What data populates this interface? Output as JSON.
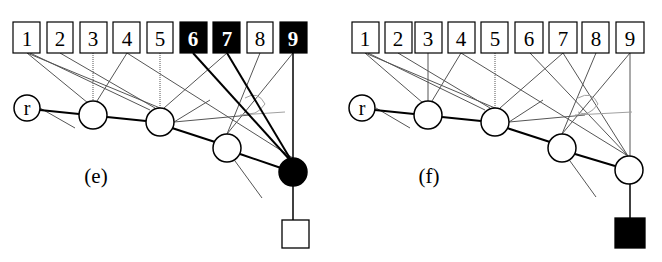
{
  "figure": {
    "panels": [
      {
        "id": "e",
        "caption": "(e)",
        "boxes": [
          {
            "label": "1",
            "filled": false
          },
          {
            "label": "2",
            "filled": false
          },
          {
            "label": "3",
            "filled": false
          },
          {
            "label": "4",
            "filled": false
          },
          {
            "label": "5",
            "filled": false
          },
          {
            "label": "6",
            "filled": true
          },
          {
            "label": "7",
            "filled": true
          },
          {
            "label": "8",
            "filled": false
          },
          {
            "label": "9",
            "filled": true
          }
        ],
        "root_label": "r",
        "chain_nodes": 4,
        "last_node_filled": true,
        "leaf_filled": false
      },
      {
        "id": "f",
        "caption": "(f)",
        "boxes": [
          {
            "label": "1",
            "filled": false
          },
          {
            "label": "2",
            "filled": false
          },
          {
            "label": "3",
            "filled": false
          },
          {
            "label": "4",
            "filled": false
          },
          {
            "label": "5",
            "filled": false
          },
          {
            "label": "6",
            "filled": false
          },
          {
            "label": "7",
            "filled": false
          },
          {
            "label": "8",
            "filled": false
          },
          {
            "label": "9",
            "filled": false
          }
        ],
        "root_label": "r",
        "chain_nodes": 4,
        "last_node_filled": false,
        "leaf_filled": true
      }
    ],
    "colors": {
      "ink": "#000000",
      "thin_edge": "#555555",
      "faint_edge": "#9a9a9a",
      "background": "#ffffff"
    }
  }
}
